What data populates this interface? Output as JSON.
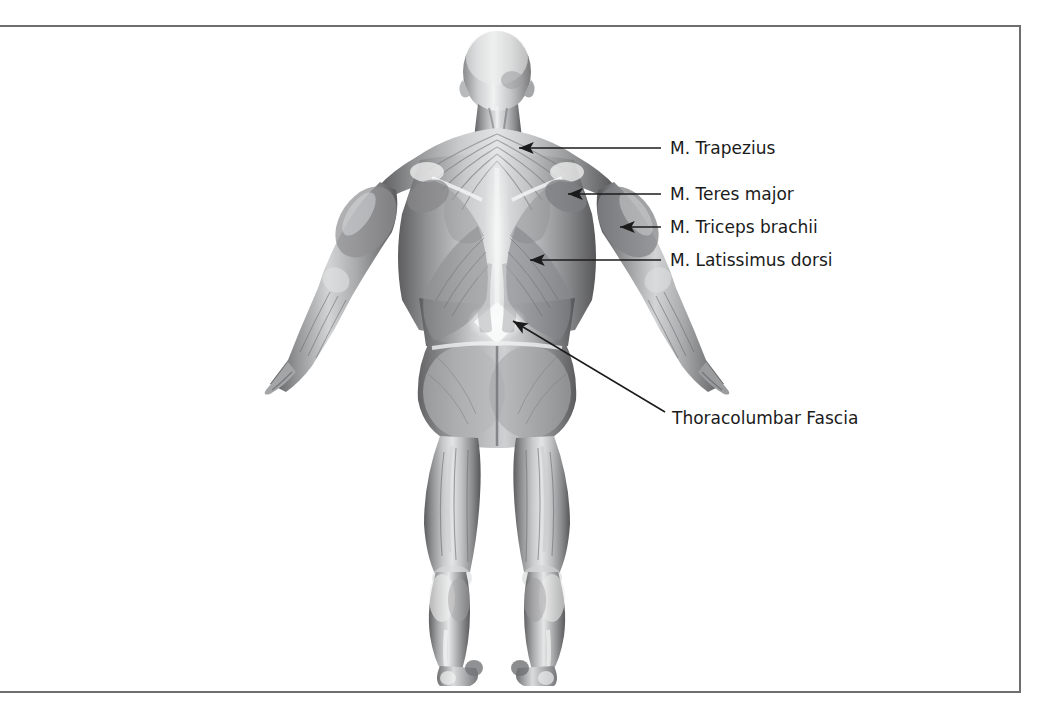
{
  "figure": {
    "view": "posterior",
    "style": "grayscale-anatomical-render",
    "background_color": "#ffffff",
    "frame_border_color": "#6e6e70"
  },
  "annotations": {
    "line_color": "#1b1b1b",
    "text_color": "#1b1b1b",
    "items": [
      {
        "label": "M. Trapezius",
        "text_x": 670,
        "text_y": 148,
        "leader_type": "arrow",
        "tip_x": 519,
        "tip_y": 148,
        "tail_x": 661,
        "tail_y": 148
      },
      {
        "label": "M. Teres major",
        "text_x": 670,
        "text_y": 194,
        "leader_type": "arrow",
        "tip_x": 568,
        "tip_y": 194,
        "tail_x": 661,
        "tail_y": 194
      },
      {
        "label": "M. Triceps brachii",
        "text_x": 670,
        "text_y": 227,
        "leader_type": "arrow",
        "tip_x": 620,
        "tip_y": 227,
        "tail_x": 661,
        "tail_y": 227
      },
      {
        "label": "M. Latissimus dorsi",
        "text_x": 670,
        "text_y": 260,
        "leader_type": "arrow",
        "tip_x": 530,
        "tip_y": 260,
        "tail_x": 661,
        "tail_y": 260
      },
      {
        "label": "Thoracolumbar Fascia",
        "text_x": 672,
        "text_y": 418,
        "leader_type": "arrow-diagonal",
        "tip_x": 513,
        "tip_y": 321,
        "tail_x": 665,
        "tail_y": 412
      }
    ]
  }
}
